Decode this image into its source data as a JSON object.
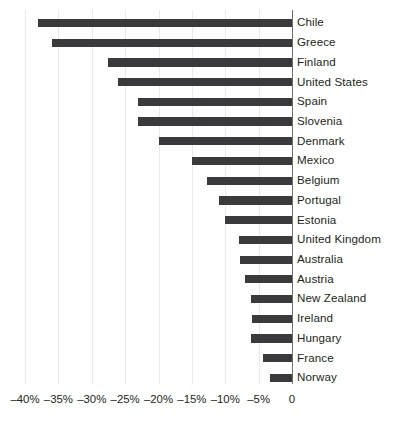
{
  "chart_data": {
    "type": "bar",
    "orientation": "horizontal",
    "title": "",
    "subtitle": "",
    "xlabel": "",
    "ylabel": "",
    "grid": true,
    "legend": false,
    "legend_position": "none",
    "xlim": [
      -40,
      0
    ],
    "xtick_values": [
      -40,
      -35,
      -30,
      -25,
      -20,
      -15,
      -10,
      -5,
      0
    ],
    "xtick_labels": [
      "–40%",
      "–35%",
      "–30%",
      "–25%",
      "–20%",
      "–15%",
      "–10%",
      "–5%",
      "0"
    ],
    "bar_color": "#3a3a3c",
    "gridline_color": "#e9e9ea",
    "axis_color": "#6f7072",
    "categories": [
      "Chile",
      "Greece",
      "Finland",
      "United States",
      "Spain",
      "Slovenia",
      "Denmark",
      "Mexico",
      "Belgium",
      "Portugal",
      "Estonia",
      "United Kingdom",
      "Australia",
      "Austria",
      "New Zealand",
      "Ireland",
      "Hungary",
      "France",
      "Norway"
    ],
    "values": [
      -38.0,
      -36.0,
      -27.5,
      -26.0,
      -23.0,
      -23.0,
      -20.0,
      -15.0,
      -12.7,
      -11.0,
      -10.0,
      -8.0,
      -7.8,
      -7.0,
      -6.2,
      -6.0,
      -6.2,
      -4.3,
      -3.3
    ]
  }
}
